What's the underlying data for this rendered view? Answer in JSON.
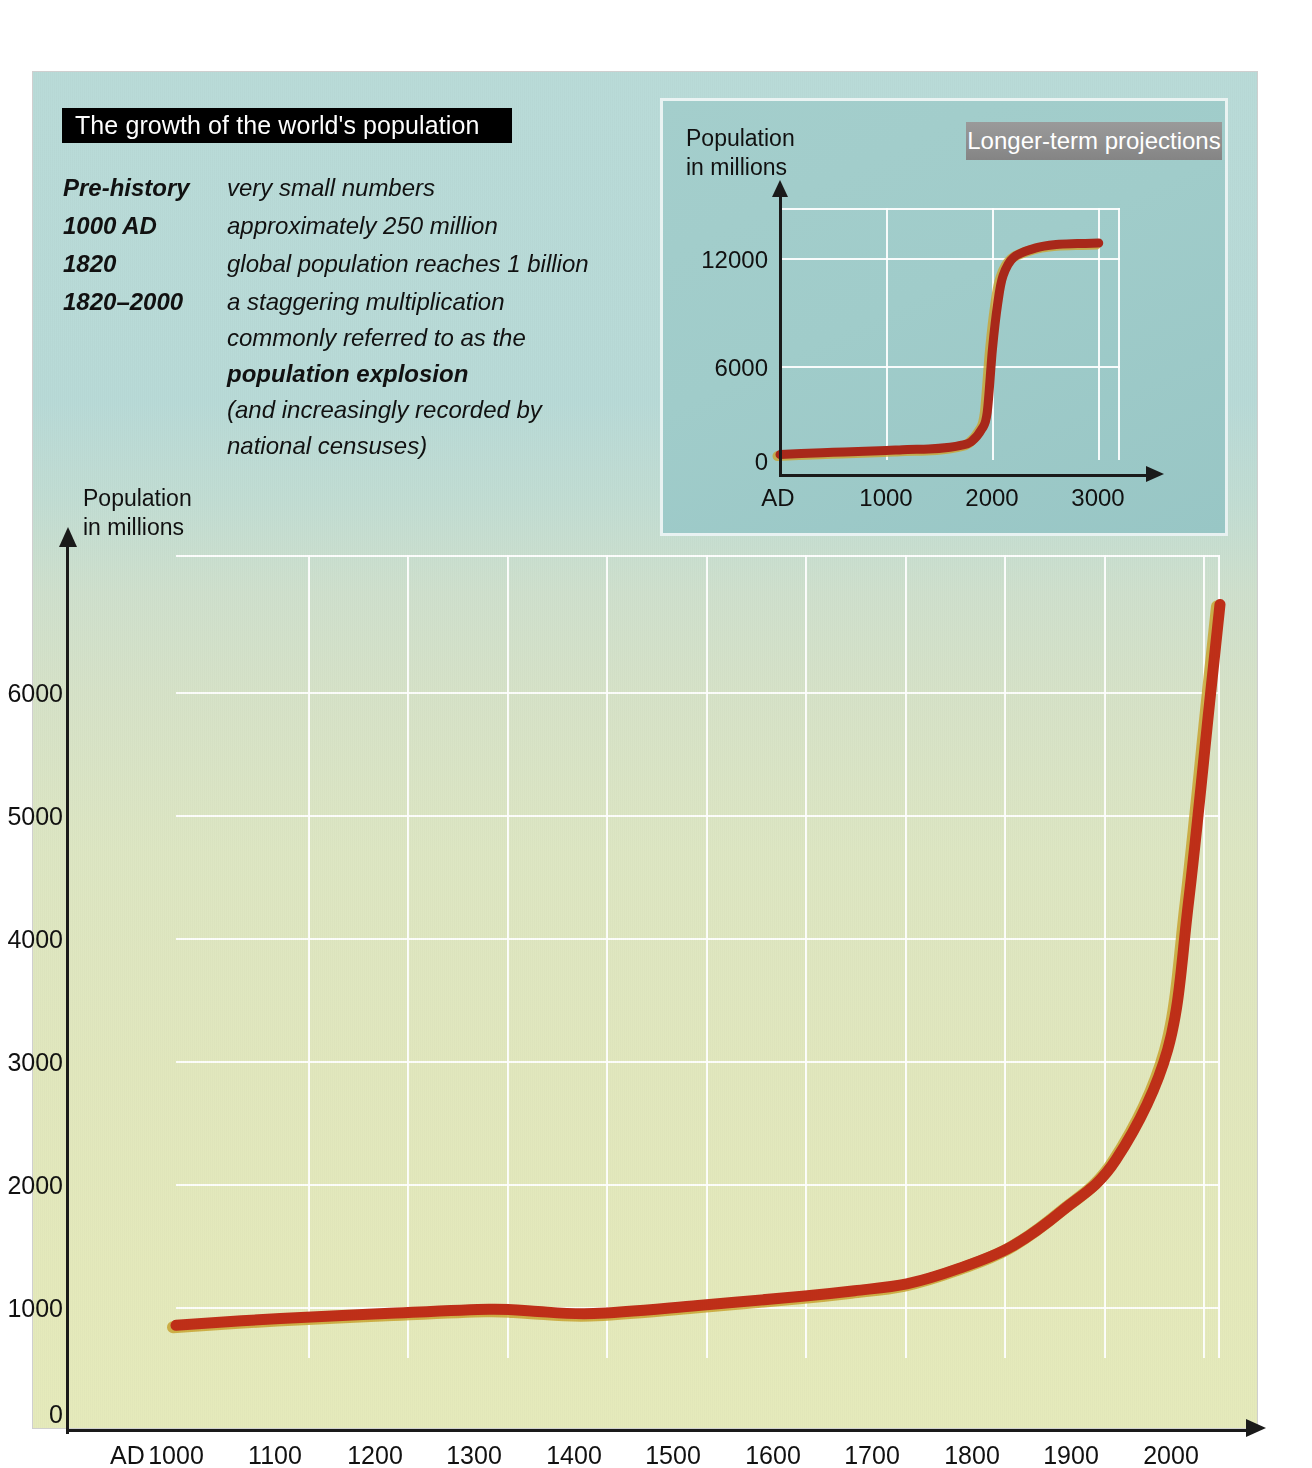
{
  "figure": {
    "title": "The growth of the world's population",
    "facts": [
      {
        "term": "Pre-history",
        "lines": [
          {
            "text": "very small numbers",
            "bold": false
          }
        ]
      },
      {
        "term": "1000 AD",
        "lines": [
          {
            "text": "approximately 250 million",
            "bold": false
          }
        ]
      },
      {
        "term": "1820",
        "lines": [
          {
            "text": "global population reaches 1 billion",
            "bold": false
          }
        ]
      },
      {
        "term": "1820–2000",
        "lines": [
          {
            "text": "a staggering multiplication",
            "bold": false
          },
          {
            "text": "commonly referred to as the",
            "bold": false
          },
          {
            "text": "population explosion",
            "bold": true
          },
          {
            "text": "(and increasingly recorded by",
            "bold": false
          },
          {
            "text": "national censuses)",
            "bold": false
          }
        ]
      }
    ],
    "colors": {
      "curve": "#bf2f18",
      "curve_shadow": "#c9a431",
      "title_bar_bg": "#000000",
      "title_bar_fg": "#ffffff",
      "badge_bg": "#8f8f8f",
      "badge_fg": "#ffffff",
      "panel_top": "#b9dbd8",
      "panel_bottom": "#e5eabb",
      "inset_bg": "#a2cfcd",
      "gridline": "#ffffff",
      "axis": "#1a1a1a"
    }
  },
  "inset": {
    "badge_label": "Longer-term projections",
    "axis_title_line1": "Population",
    "axis_title_line2": "in millions"
  },
  "main": {
    "axis_title_line1": "Population",
    "axis_title_line2": "in millions",
    "origin_label": "AD"
  },
  "chart_data": [
    {
      "type": "line",
      "id": "main-world-population",
      "title": "The growth of the world's population",
      "xlabel": "",
      "ylabel": "Population in millions",
      "xlim": [
        1000,
        2000
      ],
      "ylim": [
        0,
        6500
      ],
      "xticks": [
        1000,
        1100,
        1200,
        1300,
        1400,
        1500,
        1600,
        1700,
        1800,
        1900,
        2000
      ],
      "yticks": [
        0,
        1000,
        2000,
        3000,
        4000,
        5000,
        6000
      ],
      "xtick_labels": [
        "1000",
        "1100",
        "1200",
        "1300",
        "1400",
        "1500",
        "1600",
        "1700",
        "1800",
        "1900",
        "2000"
      ],
      "ytick_labels": [
        "0",
        "1000",
        "2000",
        "3000",
        "4000",
        "5000",
        "6000"
      ],
      "grid": true,
      "legend": "none",
      "series": [
        {
          "name": "World population",
          "color": "#bf2f18",
          "x": [
            1000,
            1100,
            1200,
            1300,
            1340,
            1400,
            1500,
            1600,
            1650,
            1700,
            1750,
            1800,
            1850,
            1900,
            1950,
            1970,
            1990,
            2000
          ],
          "values": [
            265,
            320,
            360,
            395,
            380,
            360,
            425,
            500,
            545,
            600,
            725,
            900,
            1200,
            1600,
            2500,
            3700,
            5300,
            6100
          ]
        }
      ]
    },
    {
      "type": "line",
      "id": "inset-longer-term-projections",
      "title": "Longer-term projections",
      "xlabel": "",
      "ylabel": "Population in millions",
      "xlim": [
        0,
        3200
      ],
      "ylim": [
        0,
        13800
      ],
      "xticks": [
        0,
        1000,
        2000,
        3000
      ],
      "yticks": [
        0,
        6000,
        12000
      ],
      "xtick_labels": [
        "AD",
        "1000",
        "2000",
        "3000"
      ],
      "ytick_labels": [
        "0",
        "6000",
        "12000"
      ],
      "grid": true,
      "legend": "none",
      "series": [
        {
          "name": "World population projection",
          "color": "#a8281a",
          "x": [
            0,
            200,
            500,
            800,
            1000,
            1200,
            1400,
            1600,
            1700,
            1800,
            1900,
            1950,
            2000,
            2050,
            2100,
            2200,
            2400,
            2600,
            2800,
            3000
          ],
          "values": [
            300,
            350,
            420,
            480,
            520,
            580,
            600,
            700,
            800,
            1000,
            1700,
            2600,
            6100,
            8600,
            10100,
            11100,
            11600,
            11800,
            11850,
            11880
          ]
        }
      ]
    }
  ]
}
